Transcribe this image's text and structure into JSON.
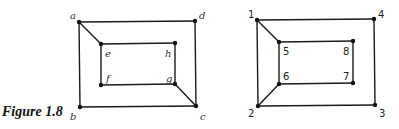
{
  "caption": "Figure 1.8",
  "graphs": [
    {
      "name": "letter-graph",
      "nodes": [
        {
          "id": "a",
          "x": 79,
          "y": 22,
          "lx": 70,
          "ly": 19
        },
        {
          "id": "d",
          "x": 195,
          "y": 21,
          "lx": 199,
          "ly": 19
        },
        {
          "id": "e",
          "x": 101,
          "y": 44,
          "lx": 105,
          "ly": 57
        },
        {
          "id": "h",
          "x": 175,
          "y": 43,
          "lx": 165,
          "ly": 57
        },
        {
          "id": "f",
          "x": 101,
          "y": 85,
          "lx": 106,
          "ly": 82
        },
        {
          "id": "g",
          "x": 175,
          "y": 84,
          "lx": 166,
          "ly": 82
        },
        {
          "id": "b",
          "x": 80,
          "y": 107,
          "lx": 70,
          "ly": 120
        },
        {
          "id": "c",
          "x": 196,
          "y": 106,
          "lx": 200,
          "ly": 120
        }
      ],
      "edges": [
        [
          "a",
          "d"
        ],
        [
          "d",
          "c"
        ],
        [
          "c",
          "b"
        ],
        [
          "b",
          "a"
        ],
        [
          "a",
          "e"
        ],
        [
          "e",
          "h"
        ],
        [
          "h",
          "g"
        ],
        [
          "g",
          "f"
        ],
        [
          "f",
          "e"
        ],
        [
          "g",
          "c"
        ]
      ]
    },
    {
      "name": "number-graph",
      "nodes": [
        {
          "id": "1",
          "x": 257,
          "y": 20,
          "lx": 248,
          "ly": 18
        },
        {
          "id": "4",
          "x": 374,
          "y": 19,
          "lx": 378,
          "ly": 18
        },
        {
          "id": "5",
          "x": 279,
          "y": 42,
          "lx": 283,
          "ly": 55
        },
        {
          "id": "8",
          "x": 353,
          "y": 41,
          "lx": 343,
          "ly": 55
        },
        {
          "id": "6",
          "x": 279,
          "y": 84,
          "lx": 283,
          "ly": 80
        },
        {
          "id": "7",
          "x": 353,
          "y": 83,
          "lx": 343,
          "ly": 80
        },
        {
          "id": "2",
          "x": 258,
          "y": 106,
          "lx": 248,
          "ly": 117
        },
        {
          "id": "3",
          "x": 375,
          "y": 105,
          "lx": 379,
          "ly": 117
        }
      ],
      "edges": [
        [
          "1",
          "4"
        ],
        [
          "4",
          "3"
        ],
        [
          "3",
          "2"
        ],
        [
          "2",
          "1"
        ],
        [
          "1",
          "5"
        ],
        [
          "5",
          "8"
        ],
        [
          "8",
          "7"
        ],
        [
          "7",
          "6"
        ],
        [
          "6",
          "5"
        ],
        [
          "6",
          "2"
        ]
      ]
    }
  ]
}
